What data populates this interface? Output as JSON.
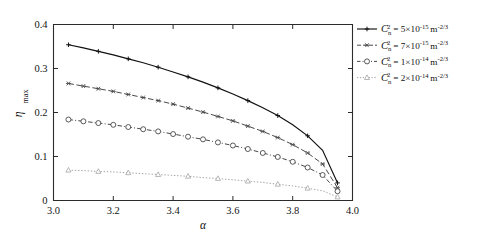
{
  "chart_data": {
    "type": "line",
    "title": "",
    "xlabel": "α",
    "ylabel": "η max",
    "xlim": [
      3.0,
      4.0
    ],
    "ylim": [
      0,
      0.4
    ],
    "xticks": [
      "3.0",
      "3.2",
      "3.4",
      "3.6",
      "3.8",
      "4.0"
    ],
    "xtick_values": [
      3.0,
      3.2,
      3.4,
      3.6,
      3.8,
      4.0
    ],
    "yticks": [
      "0",
      "0.1",
      "0.2",
      "0.3",
      "0.4"
    ],
    "ytick_values": [
      0,
      0.1,
      0.2,
      0.3,
      0.4
    ],
    "grid": false,
    "legend_position": "outside-right-top",
    "x": [
      3.05,
      3.1,
      3.15,
      3.2,
      3.25,
      3.3,
      3.35,
      3.4,
      3.45,
      3.5,
      3.55,
      3.6,
      3.65,
      3.7,
      3.75,
      3.8,
      3.85,
      3.9,
      3.95
    ],
    "series": [
      {
        "name": "Cn2 = 5×10-15 m-2/3",
        "marker": "plus",
        "linestyle": "solid",
        "values": [
          0.354,
          0.347,
          0.339,
          0.331,
          0.322,
          0.313,
          0.303,
          0.292,
          0.281,
          0.269,
          0.256,
          0.242,
          0.227,
          0.211,
          0.193,
          0.172,
          0.147,
          0.114,
          0.04
        ]
      },
      {
        "name": "Cn2 = 7×10-15 m-2/3",
        "marker": "asterisk",
        "linestyle": "dashed",
        "values": [
          0.266,
          0.26,
          0.254,
          0.248,
          0.241,
          0.234,
          0.227,
          0.219,
          0.21,
          0.201,
          0.191,
          0.181,
          0.169,
          0.157,
          0.143,
          0.127,
          0.108,
          0.083,
          0.029
        ]
      },
      {
        "name": "Cn2 = 1×10-14 m-2/3",
        "marker": "circle",
        "linestyle": "dashdot",
        "values": [
          0.184,
          0.18,
          0.176,
          0.172,
          0.167,
          0.162,
          0.157,
          0.151,
          0.145,
          0.139,
          0.132,
          0.125,
          0.117,
          0.108,
          0.099,
          0.088,
          0.075,
          0.058,
          0.021
        ]
      },
      {
        "name": "Cn2 = 2×10-14 m-2/3",
        "marker": "triangle",
        "linestyle": "dotted",
        "values": [
          0.069,
          0.068,
          0.066,
          0.065,
          0.063,
          0.061,
          0.059,
          0.057,
          0.055,
          0.052,
          0.05,
          0.047,
          0.044,
          0.041,
          0.037,
          0.033,
          0.028,
          0.022,
          0.008
        ]
      }
    ]
  },
  "legend": {
    "entries": [
      {
        "symbol": "C",
        "sub": "n",
        "sup": "2",
        "eq": " = 5×10",
        "exp": "-15",
        "unit": "m",
        "unit_exp": "-2/3"
      },
      {
        "symbol": "C",
        "sub": "n",
        "sup": "2",
        "eq": " = 7×10",
        "exp": "-15",
        "unit": "m",
        "unit_exp": "-2/3"
      },
      {
        "symbol": "C",
        "sub": "n",
        "sup": "2",
        "eq": " = 1×10",
        "exp": "-14",
        "unit": "m",
        "unit_exp": "-2/3"
      },
      {
        "symbol": "C",
        "sub": "n",
        "sup": "2",
        "eq": " = 2×10",
        "exp": "-14",
        "unit": "m",
        "unit_exp": "-2/3"
      }
    ]
  },
  "axis": {
    "ylabel_main": "η",
    "ylabel_sub": "max",
    "xlabel": "α"
  },
  "colors": {
    "series0": "#101010",
    "series1": "#4a4a4a",
    "series2": "#3d3d3d",
    "series3": "#9a9a9a",
    "axis": "#2b2b2b",
    "background": "#ffffff"
  }
}
